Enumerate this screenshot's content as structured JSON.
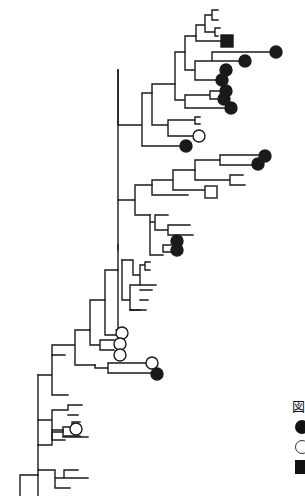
{
  "figure": {
    "type": "phylogenetic-tree",
    "stroke_color": "#1a1a1a",
    "background": "#ffffff"
  },
  "legend": {
    "title": "図",
    "items": [
      {
        "symbol": "filled-circle",
        "label": ""
      },
      {
        "symbol": "open-circle",
        "label": ""
      },
      {
        "symbol": "filled-square",
        "label": ""
      }
    ]
  },
  "tree": {
    "segments": [
      [
        20,
        496,
        20,
        465
      ],
      [
        20,
        465,
        38,
        465
      ],
      [
        38,
        375,
        38,
        496
      ],
      [
        38,
        375,
        52,
        375
      ],
      [
        52,
        375,
        52,
        395
      ],
      [
        52,
        395,
        68,
        395
      ],
      [
        38,
        440,
        60,
        440
      ],
      [
        38,
        440,
        38,
        440
      ],
      [
        60,
        345,
        60,
        400
      ],
      [
        60,
        345,
        75,
        345
      ],
      [
        75,
        345,
        75,
        330
      ],
      [
        75,
        330,
        90,
        330
      ],
      [
        60,
        400,
        75,
        400
      ],
      [
        38,
        420,
        38,
        420
      ],
      [
        90,
        330,
        90,
        300
      ],
      [
        90,
        300,
        105,
        300
      ],
      [
        105,
        300,
        105,
        270
      ],
      [
        105,
        270,
        118,
        270
      ],
      [
        118,
        270,
        118,
        0
      ],
      [
        118,
        0,
        118,
        0
      ]
    ],
    "leaves": [
      {
        "x": 221,
        "y": 41,
        "shape": "filled-square"
      },
      {
        "x": 270,
        "y": 52,
        "shape": "filled-circle"
      },
      {
        "x": 239,
        "y": 61,
        "shape": "filled-circle"
      },
      {
        "x": 220,
        "y": 70,
        "shape": "filled-circle"
      },
      {
        "x": 216,
        "y": 80,
        "shape": "filled-circle"
      },
      {
        "x": 220,
        "y": 91,
        "shape": "filled-circle"
      },
      {
        "x": 218,
        "y": 99,
        "shape": "filled-circle"
      },
      {
        "x": 225,
        "y": 108,
        "shape": "filled-circle"
      },
      {
        "x": 193,
        "y": 136,
        "shape": "open-circle"
      },
      {
        "x": 180,
        "y": 146,
        "shape": "filled-circle"
      },
      {
        "x": 259,
        "y": 156,
        "shape": "filled-circle"
      },
      {
        "x": 252,
        "y": 164,
        "shape": "filled-circle"
      },
      {
        "x": 205,
        "y": 192,
        "shape": "open-square"
      },
      {
        "x": 171,
        "y": 241,
        "shape": "filled-circle"
      },
      {
        "x": 171,
        "y": 250,
        "shape": "filled-circle"
      },
      {
        "x": 116,
        "y": 333,
        "shape": "open-circle"
      },
      {
        "x": 114,
        "y": 344,
        "shape": "open-circle"
      },
      {
        "x": 114,
        "y": 355,
        "shape": "open-circle"
      },
      {
        "x": 146,
        "y": 363,
        "shape": "open-circle"
      },
      {
        "x": 151,
        "y": 374,
        "shape": "filled-circle"
      },
      {
        "x": 70,
        "y": 429,
        "shape": "open-circle"
      }
    ]
  }
}
